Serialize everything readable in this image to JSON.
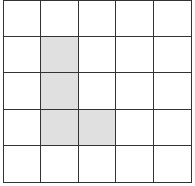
{
  "grid": {
    "rows": 5,
    "cols": 5,
    "fill_color": "#e0e0e0",
    "line_color": "#333333",
    "empty_color": "#ffffff",
    "filled_cells": [
      [
        1,
        1
      ],
      [
        2,
        1
      ],
      [
        3,
        1
      ],
      [
        3,
        2
      ]
    ]
  }
}
